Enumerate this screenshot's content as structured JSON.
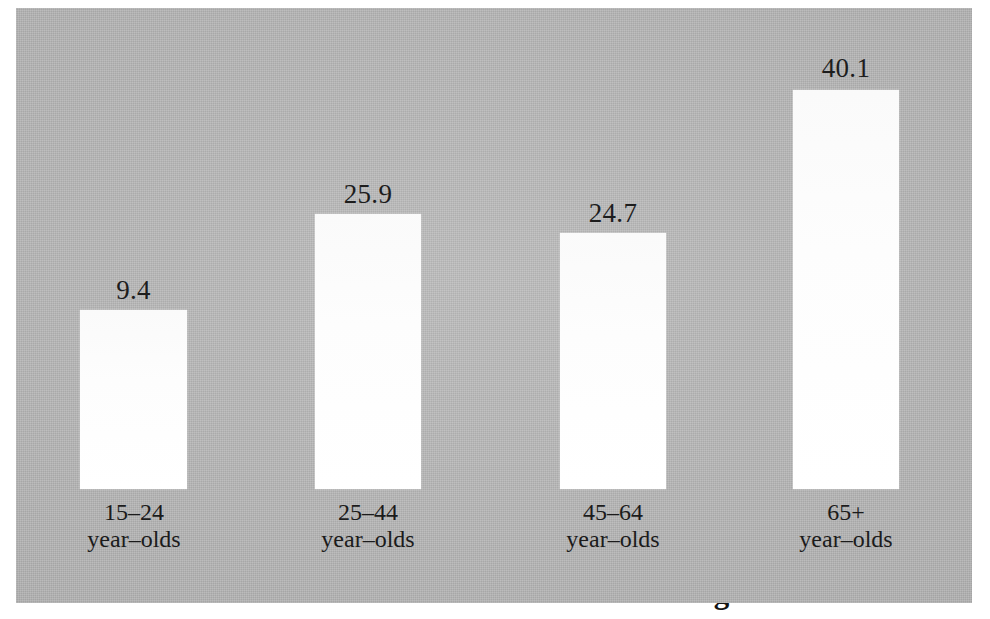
{
  "chart_data": {
    "type": "bar",
    "title": "",
    "xlabel": "",
    "ylabel": "",
    "categories": [
      "15–24 year–olds",
      "25–44 year–olds",
      "45–64 year–olds",
      "65+ year–olds"
    ],
    "values": [
      9.4,
      25.9,
      24.7,
      40.1
    ],
    "value_labels": [
      "9.4",
      "25.9",
      "24.7",
      "40.1"
    ],
    "ylim": [
      0,
      44
    ],
    "grid": false,
    "legend": null,
    "bar_color": "#fbfbfb",
    "panel_color": "#b5b5b5",
    "text_color": "#1b1b1b"
  },
  "bars": [
    {
      "value_label": "9.4",
      "category_range": "15–24",
      "category_unit": "year–olds",
      "left": 80,
      "width": 107,
      "top": 310,
      "height": 179,
      "label_left": 80,
      "label_width": 107,
      "label_top": 277,
      "cat_left": 44,
      "cat_width": 180,
      "cat_top": 499
    },
    {
      "value_label": "25.9",
      "category_range": "25–44",
      "category_unit": "year–olds",
      "left": 315,
      "width": 106,
      "top": 214,
      "height": 275,
      "label_left": 312,
      "label_width": 112,
      "label_top": 181,
      "cat_left": 278,
      "cat_width": 180,
      "cat_top": 499
    },
    {
      "value_label": "24.7",
      "category_range": "45–64",
      "category_unit": "year–olds",
      "left": 560,
      "width": 106,
      "top": 233,
      "height": 256,
      "label_left": 557,
      "label_width": 112,
      "label_top": 200,
      "cat_left": 523,
      "cat_width": 180,
      "cat_top": 499
    },
    {
      "value_label": "40.1",
      "category_range": "65+",
      "category_unit": "year–olds",
      "left": 793,
      "width": 106,
      "top": 90,
      "height": 399,
      "label_left": 790,
      "label_width": 112,
      "label_top": 55,
      "cat_left": 756,
      "cat_width": 180,
      "cat_top": 499
    }
  ],
  "panel": {
    "left": 16,
    "top": 8,
    "width": 956,
    "height": 595
  },
  "axis_title": {
    "text": "% of Persons Interested in Reading",
    "note": "clipped at bottom edge of image"
  }
}
